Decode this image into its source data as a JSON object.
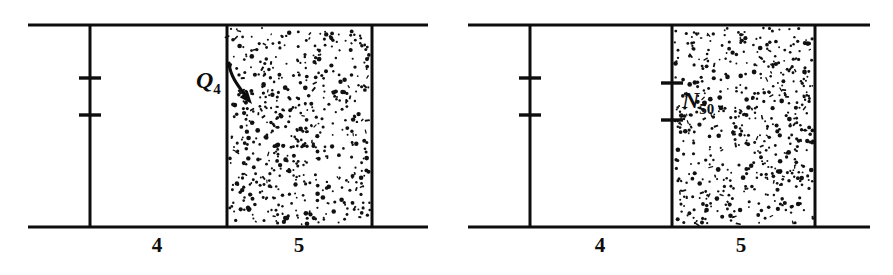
{
  "figure": {
    "title": "",
    "background_color": "#ffffff",
    "ink_color": "#0d0d0d",
    "width": 893,
    "height": 275,
    "panels": [
      {
        "id": "panel-left",
        "name": "left-diagram",
        "geometry": {
          "top_rule_y": 25,
          "bottom_rule_y": 227,
          "rule_x_start": 28,
          "rule_x_end": 428,
          "divider_x": 90,
          "stipple_x_start": 227,
          "stipple_x_end": 372
        },
        "ticks": [
          {
            "name": "tick-upper",
            "x": 90,
            "y": 78,
            "half_width": 11
          },
          {
            "name": "tick-lower",
            "x": 90,
            "y": 115,
            "half_width": 11
          }
        ],
        "callout": {
          "symbol": "Q",
          "subscript": "4",
          "label_x": 196,
          "label_y": 88,
          "arrow_from_x": 229,
          "arrow_from_y": 63,
          "arrow_to_x": 252,
          "arrow_to_y": 104
        },
        "segment_labels": [
          {
            "text": "4",
            "x": 157,
            "y": 252
          },
          {
            "text": "5",
            "x": 299,
            "y": 252
          }
        ],
        "stipple_seed": 1847,
        "stipple_count": 560
      },
      {
        "id": "panel-right",
        "name": "right-diagram",
        "geometry": {
          "top_rule_y": 25,
          "bottom_rule_y": 227,
          "rule_x_start": 468,
          "rule_x_end": 870,
          "divider_x": 530,
          "stipple_x_start": 672,
          "stipple_x_end": 815
        },
        "ticks": [
          {
            "name": "tick-upper-divider",
            "x": 530,
            "y": 78,
            "half_width": 11
          },
          {
            "name": "tick-lower-divider",
            "x": 530,
            "y": 115,
            "half_width": 11
          },
          {
            "name": "tick-upper-stipple",
            "x": 672,
            "y": 83,
            "half_width": 11
          },
          {
            "name": "tick-lower-stipple",
            "x": 672,
            "y": 120,
            "half_width": 11
          }
        ],
        "callout": {
          "symbol": "N",
          "subscript": "50",
          "label_x": 682,
          "label_y": 108
        },
        "segment_labels": [
          {
            "text": "4",
            "x": 600,
            "y": 252
          },
          {
            "text": "5",
            "x": 741,
            "y": 252
          }
        ],
        "stipple_seed": 9312,
        "stipple_count": 560
      }
    ]
  }
}
